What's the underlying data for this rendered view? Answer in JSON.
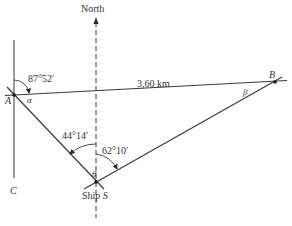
{
  "diagram": {
    "points": {
      "A": {
        "label": "A",
        "x": 14,
        "y": 95
      },
      "B": {
        "label": "B",
        "x": 276,
        "y": 81
      },
      "S": {
        "label": "Ship S",
        "x": 96,
        "y": 182
      },
      "C": {
        "label": "C"
      }
    },
    "labels": {
      "north": "North",
      "distance": "3,60 km",
      "angle_A_north": "87°52′",
      "angle_S_west": "44°14′",
      "angle_S_east": "62°10′",
      "alpha": "α",
      "beta": "β",
      "theta": "θ",
      "point_a": "A",
      "point_b": "B",
      "point_c": "C",
      "ship_prefix": "Ship",
      "ship_s": "S"
    },
    "colors": {
      "line": "#3a3a3a",
      "text": "#333333",
      "background": "#ffffff"
    }
  }
}
